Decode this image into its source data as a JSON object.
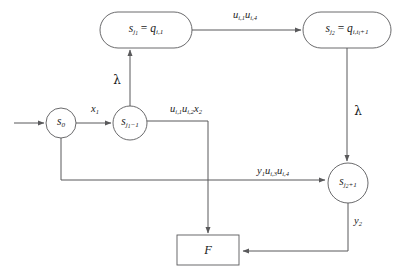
{
  "diagram": {
    "colors": {
      "stroke": "#59595b",
      "text": "#1a1a1a",
      "background": "#ffffff"
    },
    "nodes": [
      {
        "id": "s0",
        "shape": "circle",
        "label_html": "s<sub>0</sub>",
        "label_text": "s_0",
        "cx": 61,
        "cy": 123,
        "r": 15
      },
      {
        "id": "sj1m1",
        "shape": "circle",
        "label_html": "s<sub>j<sub>1</sub>&#8722;1</sub>",
        "label_text": "s_{j_1-1}",
        "cx": 130,
        "cy": 123,
        "r": 17
      },
      {
        "id": "sj1",
        "shape": "rounded-rect",
        "label_html": "s<sub>j<sub>1</sub></sub> <span class=\"op\">=</span> q<sub>i,1</sub>",
        "label_text": "s_{j_1} = q_{i,1}",
        "cx": 146,
        "cy": 30,
        "w": 92,
        "h": 36
      },
      {
        "id": "sj2",
        "shape": "rounded-rect",
        "label_html": "s<sub>j<sub>2</sub></sub> <span class=\"op\">=</span> q<sub>i,t<sub>i</sub>+1</sub>",
        "label_text": "s_{j_2} = q_{i,t_i+1}",
        "cx": 347,
        "cy": 30,
        "w": 88,
        "h": 36
      },
      {
        "id": "sj2p1",
        "shape": "circle",
        "label_html": "s<sub>j<sub>2</sub>+1</sub>",
        "label_text": "s_{j_2+1}",
        "cx": 348,
        "cy": 183,
        "r": 20
      },
      {
        "id": "F",
        "shape": "rect",
        "label_html": "F",
        "label_text": "F",
        "cx": 208,
        "cy": 250,
        "w": 62,
        "h": 30
      }
    ],
    "edge_labels": [
      {
        "id": "x1",
        "label_html": "x<sub>1</sub>",
        "label_text": "x_1",
        "x": 95,
        "y": 110
      },
      {
        "id": "lambda-up",
        "label_html": "<span class=\"greek\">&#955;</span>",
        "label_text": "lambda",
        "x": 117,
        "y": 80
      },
      {
        "id": "u-i1-u-i4",
        "label_html": "u<sub>i,1</sub>u<sub>i,4</sub>",
        "label_text": "u_{i,1}u_{i,4}",
        "x": 245,
        "y": 16
      },
      {
        "id": "lambda-down",
        "label_html": "<span class=\"greek\">&#955;</span>",
        "label_text": "lambda",
        "x": 358,
        "y": 111
      },
      {
        "id": "u-i1-u-i2-x2",
        "label_html": "u<sub>i,1</sub>u<sub>i,2</sub>x<sub>2</sub>",
        "label_text": "u_{i,1}u_{i,2}x_2",
        "x": 186,
        "y": 110
      },
      {
        "id": "y1-u-i3-u-i4",
        "label_html": "y<sub>1</sub>u<sub>i,3</sub>u<sub>i,4</sub>",
        "label_text": "y_1u_{i,3}u_{i,4}",
        "x": 273,
        "y": 172
      },
      {
        "id": "y2",
        "label_html": "y<sub>2</sub>",
        "label_text": "y_2",
        "x": 358,
        "y": 222
      }
    ],
    "edges": [
      {
        "id": "entry-to-s0",
        "from": "entry",
        "to": "s0",
        "arrow": true
      },
      {
        "id": "s0-to-sj1m1",
        "from": "s0",
        "to": "sj1m1",
        "arrow": true,
        "label": "x1"
      },
      {
        "id": "sj1m1-to-sj1",
        "from": "sj1m1",
        "to": "sj1",
        "arrow": true,
        "label": "lambda-up"
      },
      {
        "id": "sj1-to-sj2",
        "from": "sj1",
        "to": "sj2",
        "arrow": true,
        "label": "u-i1-u-i4"
      },
      {
        "id": "sj2-to-sj2p1",
        "from": "sj2",
        "to": "sj2p1",
        "arrow": true,
        "label": "lambda-down"
      },
      {
        "id": "sj1m1-to-F",
        "from": "sj1m1",
        "to": "F",
        "arrow": true,
        "label": "u-i1-u-i2-x2"
      },
      {
        "id": "s0-to-sj2p1",
        "from": "s0",
        "to": "sj2p1",
        "arrow": true,
        "label": "y1-u-i3-u-i4"
      },
      {
        "id": "sj2p1-to-F",
        "from": "sj2p1",
        "to": "F",
        "arrow": true,
        "label": "y2"
      }
    ]
  }
}
